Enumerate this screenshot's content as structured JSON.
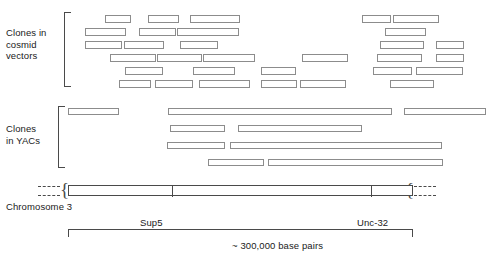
{
  "figure": {
    "type": "genomic-physical-map",
    "groups": {
      "cosmid": {
        "label": "Clones in\ncosmid\nvectors"
      },
      "yac": {
        "label": "Clones\nin YACs"
      }
    },
    "axis": {
      "chromosome_label": "Chromosome 3",
      "markers": [
        {
          "name": "Sup5",
          "x_px": 103
        },
        {
          "name": "Unc-32",
          "x_px": 302
        }
      ],
      "scale_label": "~ 300,000 base pairs"
    },
    "colors": {
      "clone_border": "#8c8c8c",
      "axis_line": "#4a4a4a",
      "text": "#1a1a1a",
      "background": "#ffffff"
    }
  },
  "chart_data": {
    "type": "bar",
    "xlabel": "Chromosome 3 position",
    "ylabel": "",
    "axis_range_px": [
      68,
      413
    ],
    "scale_total": "~ 300,000 base pairs",
    "markers": [
      "Sup5",
      "Unc-32"
    ],
    "series": [
      {
        "name": "Clones in cosmid vectors",
        "rows": [
          [
            {
              "x": 105,
              "w": 26
            },
            {
              "x": 148,
              "w": 31
            },
            {
              "x": 190,
              "w": 50
            },
            {
              "x": 362,
              "w": 29
            },
            {
              "x": 393,
              "w": 46
            }
          ],
          [
            {
              "x": 85,
              "w": 41
            },
            {
              "x": 139,
              "w": 37
            },
            {
              "x": 177,
              "w": 62
            },
            {
              "x": 385,
              "w": 41
            }
          ],
          [
            {
              "x": 85,
              "w": 37
            },
            {
              "x": 124,
              "w": 40
            },
            {
              "x": 180,
              "w": 38
            },
            {
              "x": 380,
              "w": 44
            },
            {
              "x": 436,
              "w": 28
            }
          ],
          [
            {
              "x": 110,
              "w": 46
            },
            {
              "x": 157,
              "w": 45
            },
            {
              "x": 203,
              "w": 52
            },
            {
              "x": 302,
              "w": 46
            },
            {
              "x": 377,
              "w": 45
            },
            {
              "x": 436,
              "w": 28
            }
          ],
          [
            {
              "x": 125,
              "w": 38
            },
            {
              "x": 193,
              "w": 42
            },
            {
              "x": 261,
              "w": 35
            },
            {
              "x": 373,
              "w": 39
            },
            {
              "x": 416,
              "w": 47
            }
          ],
          [
            {
              "x": 119,
              "w": 32
            },
            {
              "x": 155,
              "w": 38
            },
            {
              "x": 199,
              "w": 51
            },
            {
              "x": 261,
              "w": 36
            },
            {
              "x": 300,
              "w": 46
            },
            {
              "x": 390,
              "w": 44
            }
          ]
        ]
      },
      {
        "name": "Clones in YACs",
        "rows": [
          [
            {
              "x": 68,
              "w": 51
            },
            {
              "x": 168,
              "w": 224
            },
            {
              "x": 404,
              "w": 82
            }
          ],
          [
            {
              "x": 170,
              "w": 55
            },
            {
              "x": 238,
              "w": 124
            }
          ],
          [
            {
              "x": 167,
              "w": 58
            },
            {
              "x": 230,
              "w": 212
            }
          ],
          [
            {
              "x": 208,
              "w": 56
            },
            {
              "x": 268,
              "w": 175
            }
          ]
        ]
      }
    ]
  }
}
